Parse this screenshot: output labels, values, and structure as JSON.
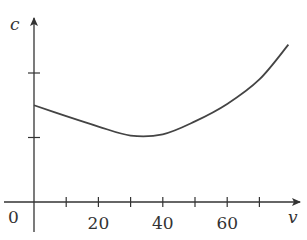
{
  "chart_data": {
    "type": "line",
    "title": "",
    "xlabel": "v",
    "ylabel": "c",
    "origin_label": "0",
    "x_ticks": [
      10,
      20,
      30,
      40,
      50,
      60,
      70
    ],
    "x_tick_labels": [
      {
        "value": 20,
        "label": "20"
      },
      {
        "value": 40,
        "label": "40"
      },
      {
        "value": 60,
        "label": "60"
      }
    ],
    "y_ticks_unlabeled": [
      1,
      2
    ],
    "xlim": [
      0,
      82
    ],
    "ylim": [
      0,
      2.8
    ],
    "grid": false,
    "legend": null,
    "series": [
      {
        "name": "c(v)",
        "x": [
          0,
          10,
          20,
          30,
          40,
          50,
          60,
          70,
          79
        ],
        "y": [
          1.5,
          1.33,
          1.17,
          1.03,
          1.05,
          1.25,
          1.52,
          1.9,
          2.44
        ]
      }
    ],
    "colors": {
      "axis": "#333333",
      "curve": "#444444"
    }
  }
}
